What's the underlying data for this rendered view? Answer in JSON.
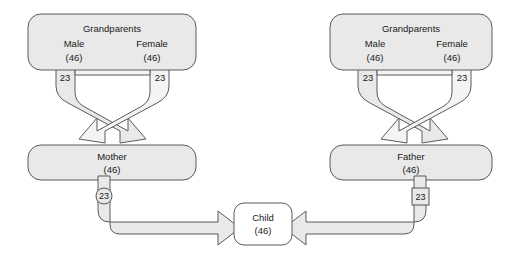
{
  "diagram": {
    "background_color": "#ffffff",
    "box_fill_color": "#e9e9e9",
    "box_border_color": "#5a5a5a",
    "child_fill_color": "#ffffff",
    "arrow_fill_color": "#e9e9e9",
    "text_color": "#1a1a1a"
  },
  "maternal": {
    "grandparents": {
      "title": "Grandparents",
      "male_label": "Male",
      "male_count": "(46)",
      "female_label": "Female",
      "female_count": "(46)",
      "male_contribution": "23",
      "female_contribution": "23"
    },
    "parent": {
      "label": "Mother",
      "count": "(46)",
      "contribution": "23",
      "contribution_shape": "circle"
    }
  },
  "paternal": {
    "grandparents": {
      "title": "Grandparents",
      "male_label": "Male",
      "male_count": "(46)",
      "female_label": "Female",
      "female_count": "(46)",
      "male_contribution": "23",
      "female_contribution": "23"
    },
    "parent": {
      "label": "Father",
      "count": "(46)",
      "contribution": "23",
      "contribution_shape": "square"
    }
  },
  "child": {
    "label": "Child",
    "count": "(46)"
  }
}
